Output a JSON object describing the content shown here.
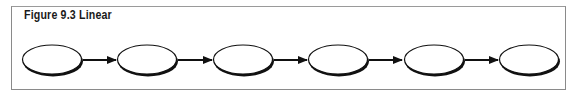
{
  "figure": {
    "title": "Figure 9.3 Linear",
    "border_color": "#8a8a8a"
  },
  "diagram": {
    "type": "linear-flow",
    "node_count": 6,
    "nodes": [
      {
        "id": 1,
        "label": ""
      },
      {
        "id": 2,
        "label": ""
      },
      {
        "id": 3,
        "label": ""
      },
      {
        "id": 4,
        "label": ""
      },
      {
        "id": 5,
        "label": ""
      },
      {
        "id": 6,
        "label": ""
      }
    ],
    "edges": [
      {
        "from": 1,
        "to": 2
      },
      {
        "from": 2,
        "to": 3
      },
      {
        "from": 3,
        "to": 4
      },
      {
        "from": 4,
        "to": 5
      },
      {
        "from": 5,
        "to": 6
      }
    ],
    "stroke_color": "#111111"
  }
}
